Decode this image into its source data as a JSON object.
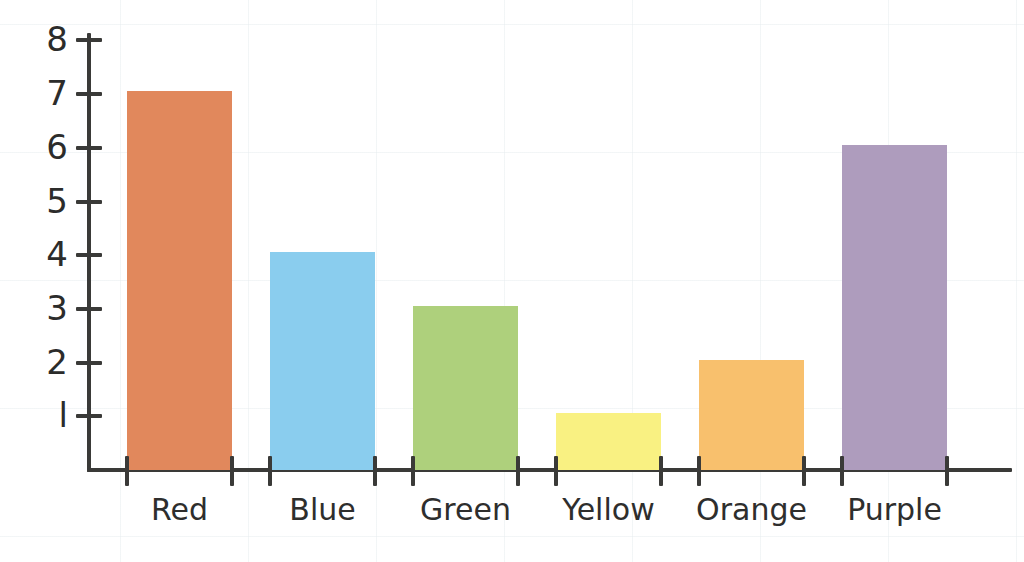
{
  "chart_data": {
    "type": "bar",
    "title": "",
    "subtitle": "",
    "xlabel": "",
    "ylabel": "",
    "categories": [
      "Red",
      "Blue",
      "Green",
      "Yellow",
      "Orange",
      "Purple"
    ],
    "values": [
      7,
      4,
      3,
      1,
      2,
      6
    ],
    "series": [
      {
        "name": "Count",
        "values": [
          7,
          4,
          3,
          1,
          2,
          6
        ]
      }
    ],
    "bar_colors": [
      "#E1885C",
      "#8ACDEE",
      "#AED07C",
      "#F9F182",
      "#F8C06D",
      "#AE9CBD"
    ],
    "ylim": [
      0,
      8.6
    ],
    "yticks": [
      1,
      2,
      3,
      4,
      5,
      6,
      7,
      8
    ],
    "ytick_labels": [
      "l",
      "2",
      "3",
      "4",
      "5",
      "6",
      "7",
      "8"
    ],
    "grid": false,
    "legend": "none",
    "axis_color": "#3a3a38",
    "background_color": "#ffffff"
  },
  "axis": {
    "y_axis_name": "y-axis-line",
    "x_axis_name": "x-axis-line"
  }
}
